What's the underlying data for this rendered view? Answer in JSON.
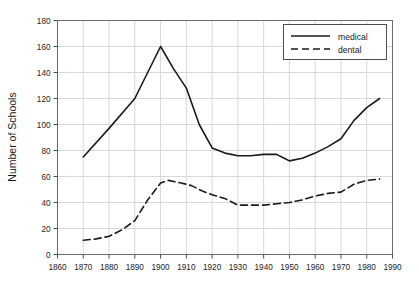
{
  "chart_data": {
    "type": "line",
    "title": "",
    "xlabel": "",
    "ylabel": "Number of Schools",
    "xlim": [
      1860,
      1990
    ],
    "ylim": [
      0,
      180
    ],
    "xticks": [
      1860,
      1870,
      1880,
      1890,
      1900,
      1910,
      1920,
      1930,
      1940,
      1950,
      1960,
      1970,
      1980,
      1990
    ],
    "yticks": [
      0,
      20,
      40,
      60,
      80,
      100,
      120,
      140,
      160,
      180
    ],
    "grid": true,
    "legend_position": "top-right",
    "series": [
      {
        "name": "medical",
        "style": "solid",
        "color": "#1a1a1a",
        "x": [
          1870,
          1880,
          1890,
          1895,
          1900,
          1905,
          1910,
          1915,
          1920,
          1925,
          1930,
          1935,
          1940,
          1945,
          1948,
          1950,
          1955,
          1960,
          1965,
          1970,
          1975,
          1980,
          1985
        ],
        "y": [
          75,
          97,
          120,
          140,
          160,
          143,
          128,
          100,
          82,
          78,
          76,
          76,
          77,
          77,
          74,
          72,
          74,
          78,
          83,
          89,
          103,
          113,
          120
        ]
      },
      {
        "name": "dental",
        "style": "dashed",
        "color": "#1a1a1a",
        "x": [
          1870,
          1875,
          1880,
          1885,
          1890,
          1895,
          1900,
          1903,
          1908,
          1912,
          1916,
          1920,
          1925,
          1930,
          1935,
          1940,
          1945,
          1950,
          1955,
          1960,
          1965,
          1970,
          1975,
          1980,
          1985
        ],
        "y": [
          11,
          12,
          14,
          19,
          26,
          42,
          55,
          57,
          55,
          53,
          49,
          46,
          43,
          38,
          38,
          38,
          39,
          40,
          42,
          45,
          47,
          48,
          54,
          57,
          58
        ]
      }
    ]
  },
  "legend": {
    "items": [
      {
        "label": "medical"
      },
      {
        "label": "dental"
      }
    ]
  },
  "axes": {
    "y_title": "Number of Schools"
  }
}
